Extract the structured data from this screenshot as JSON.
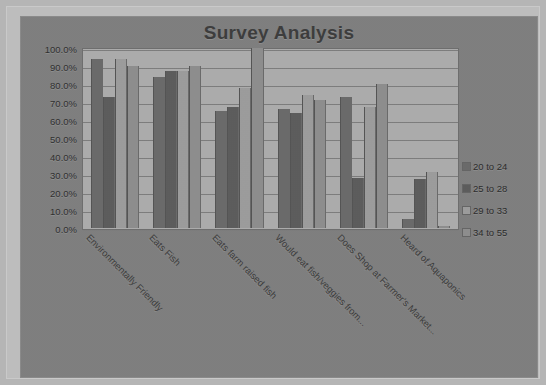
{
  "chart_data": {
    "type": "bar",
    "title": "Survey Analysis",
    "xlabel": "",
    "ylabel": "",
    "ylim": [
      0,
      1.0
    ],
    "grid": true,
    "legend_position": "right",
    "tick_labels": [
      "100.0%",
      "90.0%",
      "80.0%",
      "70.0%",
      "60.0%",
      "50.0%",
      "40.0%",
      "30.0%",
      "20.0%",
      "10.0%",
      "0.0%"
    ],
    "categories": [
      "Environmentally Friendly",
      "Eats Fish",
      "Eats farm raised fish",
      "Would eat fish/veggies from...",
      "Does Shop at Farmer's Market...",
      "Heard of Aquaponics"
    ],
    "series": [
      {
        "name": "20 to 24",
        "color": "#6a6a6a",
        "values": [
          94,
          84,
          65,
          66,
          73,
          5
        ]
      },
      {
        "name": "25 to 28",
        "color": "#5c5c5c",
        "values": [
          73,
          87,
          67,
          64,
          28,
          27
        ]
      },
      {
        "name": "29 to 33",
        "color": "#9d9d9d",
        "values": [
          94,
          87,
          78,
          74,
          67,
          31
        ]
      },
      {
        "name": "34 to 55",
        "color": "#8e8e8e",
        "values": [
          90,
          90,
          100,
          71,
          80,
          1
        ]
      }
    ],
    "value_unit": "%"
  }
}
